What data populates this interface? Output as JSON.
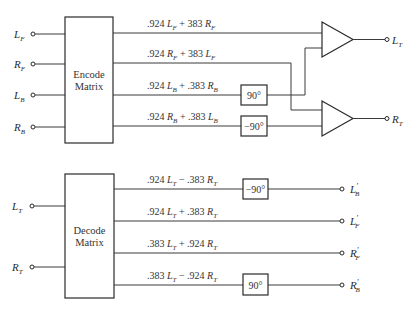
{
  "encoder": {
    "block": {
      "line1": "Encode",
      "line2": "Matrix"
    },
    "inputs": [
      {
        "var": "L",
        "sub": "F"
      },
      {
        "var": "R",
        "sub": "F"
      },
      {
        "var": "L",
        "sub": "B"
      },
      {
        "var": "R",
        "sub": "B"
      }
    ],
    "equations": [
      {
        "c1": ".924",
        "v1": "L",
        "s1": "F",
        "op": "+",
        "c2": "383",
        "v2": "R",
        "s2": "F"
      },
      {
        "c1": ".924",
        "v1": "R",
        "s1": "F",
        "op": "+",
        "c2": "383",
        "v2": "L",
        "s2": "F"
      },
      {
        "c1": ".924",
        "v1": "L",
        "s1": "B",
        "op": "+",
        "c2": ".383",
        "v2": "R",
        "s2": "B"
      },
      {
        "c1": ".924",
        "v1": "R",
        "s1": "B",
        "op": "+",
        "c2": ".383",
        "v2": "L",
        "s2": "B"
      }
    ],
    "phase_shifters": [
      "90°",
      "−90°"
    ],
    "outputs": [
      {
        "var": "L",
        "sub": "T"
      },
      {
        "var": "R",
        "sub": "T"
      }
    ]
  },
  "decoder": {
    "block": {
      "line1": "Decode",
      "line2": "Matrix"
    },
    "inputs": [
      {
        "var": "L",
        "sub": "T"
      },
      {
        "var": "R",
        "sub": "T"
      }
    ],
    "equations": [
      {
        "c1": ".924",
        "v1": "L",
        "s1": "T",
        "op": "−",
        "c2": ".383",
        "v2": "R",
        "s2": "T"
      },
      {
        "c1": ".924",
        "v1": "L",
        "s1": "T",
        "op": "+",
        "c2": ".383",
        "v2": "R",
        "s2": "T"
      },
      {
        "c1": ".383",
        "v1": "L",
        "s1": "T",
        "op": "+",
        "c2": ".924",
        "v2": "R",
        "s2": "T"
      },
      {
        "c1": ".383",
        "v1": "L",
        "s1": "T",
        "op": "−",
        "c2": ".924",
        "v2": "R",
        "s2": "T"
      }
    ],
    "phase_shifters": [
      "−90°",
      "90°"
    ],
    "outputs": [
      {
        "var": "L",
        "prime": "′",
        "sub": "B"
      },
      {
        "var": "L",
        "prime": "′",
        "sub": "F"
      },
      {
        "var": "R",
        "prime": "′",
        "sub": "F"
      },
      {
        "var": "R",
        "prime": "′",
        "sub": "B"
      }
    ]
  }
}
